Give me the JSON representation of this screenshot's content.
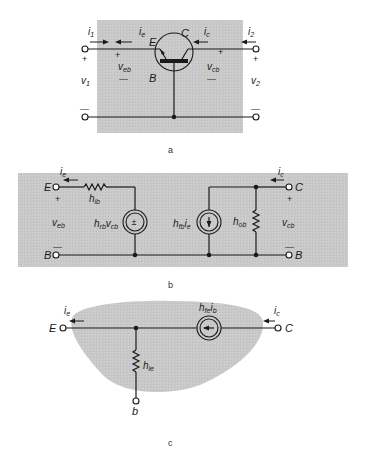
{
  "colors": {
    "background": "#ffffff",
    "shading": "#c9c9c9",
    "ink": "#1a1a1a"
  },
  "figure_a": {
    "caption": "a",
    "labels": {
      "i1": "i",
      "i1_sub": "1",
      "ie": "i",
      "ie_sub": "e",
      "ic": "i",
      "ic_sub": "c",
      "i2": "i",
      "i2_sub": "2",
      "emitter": "E",
      "collector": "C",
      "base": "B",
      "veb": "v",
      "veb_sub": "eb",
      "vcb": "v",
      "vcb_sub": "cb",
      "v1": "v",
      "v1_sub": "1",
      "v2": "v",
      "v2_sub": "2",
      "plus": "+",
      "minus": "—"
    }
  },
  "figure_b": {
    "caption": "b",
    "labels": {
      "ie": "i",
      "ie_sub": "e",
      "ic": "i",
      "ic_sub": "c",
      "emitter": "E",
      "collector": "C",
      "base_left": "B",
      "base_right": "B",
      "hib": "h",
      "hib_sub": "ib",
      "hrb": "h",
      "hrb_sub": "rb",
      "hrb_v": "v",
      "hrb_v_sub": "cb",
      "hfb": "h",
      "hfb_sub": "fb",
      "hfb_i": "i",
      "hfb_i_sub": "e",
      "hob": "h",
      "hob_sub": "ob",
      "veb": "v",
      "veb_sub": "eb",
      "vcb": "v",
      "vcb_sub": "cb",
      "voltage_source_symbol": "±",
      "plus": "+",
      "minus": "—"
    }
  },
  "figure_c": {
    "caption": "c",
    "labels": {
      "ie": "i",
      "ie_sub": "e",
      "ic": "i",
      "ic_sub": "c",
      "emitter": "E",
      "collector": "C",
      "base": "b",
      "hie": "h",
      "hie_sub": "ie",
      "hfe": "h",
      "hfe_sub": "fe",
      "hfe_i": "i",
      "hfe_i_sub": "b"
    }
  }
}
